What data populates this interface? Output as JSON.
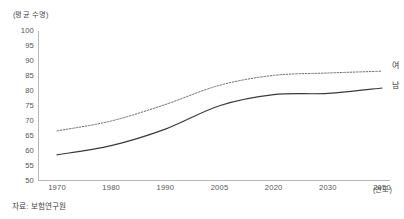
{
  "figure": {
    "y_unit_label": "(평균 수명)",
    "x_unit_label": "(연도)",
    "source_note": "자료: 보험연구원",
    "label_female": "여",
    "label_male": "남"
  },
  "colors": {
    "axis": "#b9b9b9",
    "text": "#4a4a4a",
    "line_male": "#3a3a3a",
    "line_female": "#6b6b6b",
    "background": "#ffffff"
  },
  "chart_data": {
    "type": "line",
    "title": "",
    "subtitle": "",
    "xlabel": "(연도)",
    "ylabel": "(평균 수명)",
    "ylim": [
      50,
      100
    ],
    "yticks": [
      100,
      95,
      90,
      85,
      80,
      75,
      70,
      65,
      60,
      55,
      50
    ],
    "grid": false,
    "legend_position": "right-end-of-line",
    "categories": [
      "1970",
      "1980",
      "1990",
      "2005",
      "2020",
      "2030",
      "2050"
    ],
    "x_spacing": "categorical-even",
    "series": [
      {
        "name": "여",
        "style": "dotted",
        "color": "#6b6b6b",
        "values": [
          66.7,
          70.0,
          75.5,
          81.9,
          85.2,
          86.0,
          86.6
        ]
      },
      {
        "name": "남",
        "style": "solid",
        "color": "#3a3a3a",
        "values": [
          58.7,
          61.8,
          67.3,
          75.1,
          78.8,
          79.2,
          81.0
        ]
      }
    ],
    "annotations": [
      "자료: 보험연구원"
    ]
  }
}
